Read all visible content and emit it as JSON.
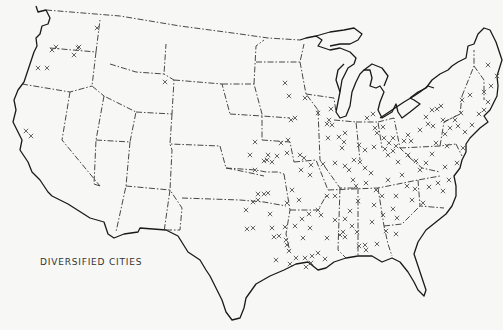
{
  "map": {
    "title": "DIVERSIFIED CITIES",
    "region": "United States (conterminous)",
    "marker_symbol": "×",
    "colors": {
      "background": "#f7f7f5",
      "lines": "#1a1a1a",
      "markers": "#555555"
    },
    "markers": [
      [
        52,
        50
      ],
      [
        56,
        47
      ],
      [
        78,
        48
      ],
      [
        74,
        55
      ],
      [
        79,
        47
      ],
      [
        38,
        68
      ],
      [
        47,
        68
      ],
      [
        26,
        131
      ],
      [
        31,
        136
      ],
      [
        97,
        28
      ],
      [
        165,
        82
      ],
      [
        285,
        83
      ],
      [
        289,
        96
      ],
      [
        305,
        98
      ],
      [
        291,
        120
      ],
      [
        295,
        118
      ],
      [
        281,
        143
      ],
      [
        288,
        140
      ],
      [
        287,
        153
      ],
      [
        300,
        155
      ],
      [
        304,
        158
      ],
      [
        318,
        113
      ],
      [
        331,
        109
      ],
      [
        329,
        120
      ],
      [
        327,
        124
      ],
      [
        332,
        125
      ],
      [
        328,
        138
      ],
      [
        339,
        137
      ],
      [
        345,
        133
      ],
      [
        342,
        148
      ],
      [
        344,
        142
      ],
      [
        354,
        160
      ],
      [
        360,
        162
      ],
      [
        365,
        168
      ],
      [
        371,
        173
      ],
      [
        349,
        170
      ],
      [
        353,
        180
      ],
      [
        365,
        150
      ],
      [
        359,
        145
      ],
      [
        375,
        128
      ],
      [
        383,
        127
      ],
      [
        367,
        118
      ],
      [
        373,
        114
      ],
      [
        377,
        133
      ],
      [
        384,
        138
      ],
      [
        385,
        149
      ],
      [
        374,
        147
      ],
      [
        388,
        155
      ],
      [
        393,
        151
      ],
      [
        389,
        143
      ],
      [
        393,
        138
      ],
      [
        396,
        146
      ],
      [
        404,
        141
      ],
      [
        408,
        135
      ],
      [
        411,
        141
      ],
      [
        408,
        155
      ],
      [
        416,
        161
      ],
      [
        398,
        162
      ],
      [
        420,
        130
      ],
      [
        428,
        124
      ],
      [
        433,
        126
      ],
      [
        426,
        117
      ],
      [
        432,
        110
      ],
      [
        437,
        109
      ],
      [
        441,
        106
      ],
      [
        443,
        120
      ],
      [
        445,
        134
      ],
      [
        436,
        143
      ],
      [
        432,
        154
      ],
      [
        426,
        163
      ],
      [
        420,
        170
      ],
      [
        402,
        175
      ],
      [
        407,
        186
      ],
      [
        415,
        189
      ],
      [
        412,
        200
      ],
      [
        423,
        203
      ],
      [
        438,
        183
      ],
      [
        429,
        187
      ],
      [
        443,
        191
      ],
      [
        449,
        180
      ],
      [
        457,
        163
      ],
      [
        463,
        148
      ],
      [
        465,
        132
      ],
      [
        472,
        125
      ],
      [
        479,
        114
      ],
      [
        484,
        110
      ],
      [
        488,
        102
      ],
      [
        484,
        92
      ],
      [
        491,
        86
      ],
      [
        497,
        76
      ],
      [
        488,
        65
      ],
      [
        470,
        95
      ],
      [
        462,
        100
      ],
      [
        461,
        113
      ],
      [
        455,
        120
      ],
      [
        450,
        128
      ],
      [
        447,
        146
      ],
      [
        445,
        167
      ],
      [
        458,
        126
      ],
      [
        255,
        142
      ],
      [
        250,
        155
      ],
      [
        264,
        161
      ],
      [
        267,
        160
      ],
      [
        272,
        162
      ],
      [
        277,
        156
      ],
      [
        258,
        194
      ],
      [
        264,
        194
      ],
      [
        268,
        193
      ],
      [
        258,
        200
      ],
      [
        253,
        202
      ],
      [
        246,
        210
      ],
      [
        247,
        229
      ],
      [
        253,
        228
      ],
      [
        272,
        228
      ],
      [
        285,
        227
      ],
      [
        274,
        237
      ],
      [
        279,
        236
      ],
      [
        286,
        240
      ],
      [
        295,
        226
      ],
      [
        302,
        219
      ],
      [
        309,
        214
      ],
      [
        318,
        210
      ],
      [
        327,
        196
      ],
      [
        335,
        196
      ],
      [
        345,
        219
      ],
      [
        352,
        226
      ],
      [
        345,
        237
      ],
      [
        343,
        232
      ],
      [
        335,
        220
      ],
      [
        340,
        235
      ],
      [
        357,
        232
      ],
      [
        359,
        246
      ],
      [
        365,
        245
      ],
      [
        366,
        250
      ],
      [
        377,
        244
      ],
      [
        386,
        231
      ],
      [
        393,
        209
      ],
      [
        396,
        196
      ],
      [
        396,
        234
      ],
      [
        397,
        218
      ],
      [
        287,
        203
      ],
      [
        292,
        190
      ],
      [
        301,
        170
      ],
      [
        311,
        165
      ],
      [
        310,
        175
      ],
      [
        255,
        170
      ],
      [
        268,
        155
      ],
      [
        289,
        251
      ],
      [
        296,
        258
      ],
      [
        305,
        258
      ],
      [
        312,
        256
      ],
      [
        318,
        253
      ],
      [
        325,
        259
      ],
      [
        311,
        263
      ],
      [
        327,
        238
      ],
      [
        306,
        267
      ],
      [
        290,
        264
      ],
      [
        303,
        238
      ],
      [
        310,
        228
      ],
      [
        321,
        215
      ],
      [
        299,
        200
      ],
      [
        270,
        214
      ],
      [
        276,
        260
      ],
      [
        287,
        245
      ],
      [
        323,
        164
      ],
      [
        335,
        163
      ],
      [
        345,
        166
      ],
      [
        356,
        186
      ],
      [
        366,
        183
      ],
      [
        376,
        190
      ],
      [
        382,
        196
      ],
      [
        388,
        180
      ],
      [
        374,
        205
      ],
      [
        358,
        201
      ],
      [
        350,
        211
      ],
      [
        372,
        222
      ],
      [
        383,
        215
      ]
    ]
  }
}
